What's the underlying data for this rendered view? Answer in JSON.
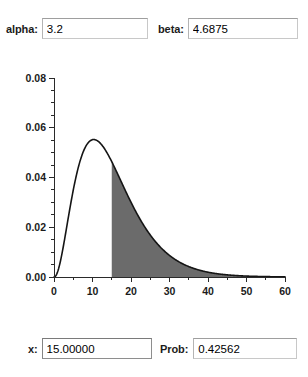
{
  "window": {
    "title": "Gamma Distribution Probability Calculator"
  },
  "parameters": {
    "alpha": {
      "label": "alpha:",
      "value": "3.2",
      "placeholder": ""
    },
    "beta": {
      "label": "beta:",
      "value": "4.6875",
      "placeholder": ""
    }
  },
  "results": {
    "x": {
      "label": "x:",
      "value": "15.00000",
      "placeholder": ""
    },
    "prob": {
      "label": "Prob:",
      "value": "0.42562",
      "placeholder": ""
    }
  },
  "colors": {
    "shade": "#6b6b6b",
    "curve": "#151515",
    "axis": "#2a2a2a",
    "background": "#ffffff",
    "input_border": "#c8c8c8",
    "input_border_focused": "#8e8e8e"
  },
  "chart_data": {
    "type": "area",
    "title": "",
    "xlabel": "",
    "ylabel": "",
    "xlim": [
      0,
      60
    ],
    "ylim": [
      0,
      0.08
    ],
    "grid": false,
    "legend": null,
    "x_ticks_major": [
      0,
      10,
      20,
      30,
      40,
      50,
      60
    ],
    "x_tick_labels": [
      "0",
      "10",
      "20",
      "30",
      "40",
      "50",
      "60"
    ],
    "x_tick_minor_step": 5,
    "y_ticks_major": [
      0.0,
      0.02,
      0.04,
      0.06,
      0.08
    ],
    "y_tick_labels": [
      "0.00",
      "0.02",
      "0.04",
      "0.06",
      "0.08"
    ],
    "y_tick_minor_step": 0.005,
    "distribution": "gamma",
    "shape_alpha": 3.2,
    "scale_beta": 4.6875,
    "shade_from": 15,
    "shade_to": 60,
    "shaded_probability": 0.42562,
    "peak_x": 10.3,
    "peak_y": 0.0553,
    "x": [
      0,
      1,
      2,
      3,
      4,
      5,
      6,
      7,
      8,
      9,
      10,
      11,
      12,
      13,
      14,
      15,
      16,
      17,
      18,
      19,
      20,
      22,
      24,
      26,
      28,
      30,
      32,
      34,
      36,
      38,
      40,
      42,
      44,
      46,
      48,
      50,
      52,
      54,
      56,
      58,
      60
    ],
    "y": [
      0.0,
      0.0043,
      0.0112,
      0.0186,
      0.0257,
      0.032,
      0.0375,
      0.042,
      0.0456,
      0.0483,
      0.0503,
      0.0516,
      0.0523,
      0.0526,
      0.0524,
      0.0519,
      0.0511,
      0.0501,
      0.0489,
      0.0475,
      0.046,
      0.0427,
      0.0392,
      0.0357,
      0.0322,
      0.0288,
      0.0256,
      0.0226,
      0.0199,
      0.0174,
      0.0151,
      0.0131,
      0.0113,
      0.0097,
      0.0083,
      0.0071,
      0.006,
      0.0051,
      0.0043,
      0.0036,
      0.003
    ]
  }
}
